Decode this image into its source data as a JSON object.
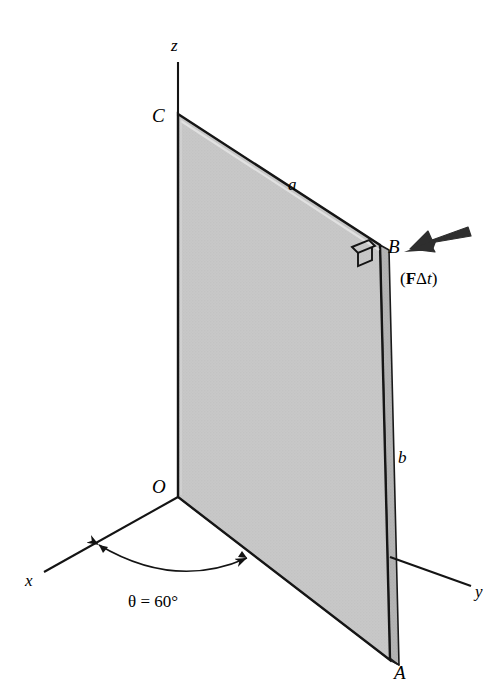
{
  "figure": {
    "background_color": "#ffffff",
    "plate": {
      "name": "rectangular-plate",
      "fill_color": "#c6c6c6",
      "edge_face_color": "#b0b0b0",
      "outline_color": "#1a1a1a",
      "corners": {
        "C": {
          "x": 178,
          "y": 114
        },
        "B": {
          "x": 380,
          "y": 245
        },
        "A": {
          "x": 390,
          "y": 660
        },
        "O": {
          "x": 178,
          "y": 497
        }
      },
      "thickness_px": 9
    },
    "axes": [
      {
        "label": "z",
        "name": "z-axis",
        "x1": 178,
        "y1": 62,
        "x2": 178,
        "y2": 114,
        "label_x": 176,
        "label_y": 50
      },
      {
        "label": "x",
        "name": "x-axis",
        "x1": 178,
        "y1": 497,
        "x2": 44,
        "y2": 572,
        "label_x": 26,
        "label_y": 584
      },
      {
        "label": "y",
        "name": "y-axis",
        "x1": 390,
        "y1": 557,
        "x2": 471,
        "y2": 586,
        "label_x": 477,
        "label_y": 597
      }
    ],
    "point_labels": [
      {
        "text": "C",
        "name": "point-label-c",
        "x": 155,
        "y": 121
      },
      {
        "text": "B",
        "name": "point-label-b",
        "x": 390,
        "y": 252
      },
      {
        "text": "O",
        "name": "point-label-o",
        "x": 155,
        "y": 492
      },
      {
        "text": "A",
        "name": "point-label-a",
        "x": 396,
        "y": 678
      }
    ],
    "dimension_labels": [
      {
        "text": "a",
        "name": "dimension-label-a",
        "x": 291,
        "y": 189
      },
      {
        "text": "b",
        "name": "dimension-label-b",
        "x": 399,
        "y": 462
      }
    ],
    "angle": {
      "name": "theta-angle",
      "text": "θ = 60°",
      "value_degrees": 60,
      "label_x": 132,
      "label_y": 605,
      "arc_start": {
        "x": 96,
        "y": 546
      },
      "arc_end": {
        "x": 250,
        "y": 559
      },
      "arc_control": {
        "x": 173,
        "y": 588
      }
    },
    "impulse": {
      "name": "impulse-vector",
      "label_parts": {
        "open": "(",
        "force": "F",
        "delta": "Δ",
        "time": "t",
        "close": ")"
      },
      "label_text": "(FΔt)",
      "label_x": 402,
      "label_y": 282,
      "arrow_color": "#2b2b2b",
      "arrow_tail": {
        "x": 470,
        "y": 228
      },
      "arrow_head": {
        "x": 403,
        "y": 252
      }
    },
    "right_angle_marker": {
      "name": "right-angle-marker",
      "description": "perpendicularity symbol at corner B",
      "x": 356,
      "y": 243
    }
  }
}
